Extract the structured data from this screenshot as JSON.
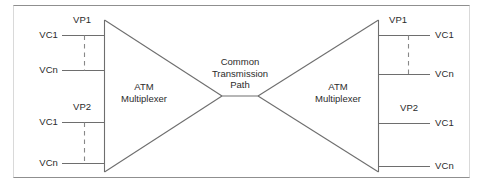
{
  "figure": {
    "stroke_color": "#6e6e6e",
    "frame_color": "#9a9a9a",
    "text_color": "#2b2b2b",
    "background": "#ffffff"
  },
  "center": {
    "line1": "Common",
    "line2": "Transmission",
    "line3": "Path"
  },
  "left_mux": {
    "line1": "ATM",
    "line2": "Multiplexer"
  },
  "right_mux": {
    "line1": "ATM",
    "line2": "Multiplexer"
  },
  "left_groups": [
    {
      "vp_label": "VP1",
      "channels": [
        {
          "label": "VC1"
        },
        {
          "label": "VCn"
        }
      ],
      "has_ellipsis_line": true
    },
    {
      "vp_label": "VP2",
      "channels": [
        {
          "label": "VC1"
        },
        {
          "label": "VCn"
        }
      ],
      "has_ellipsis_line": true
    }
  ],
  "right_groups": [
    {
      "vp_label": "VP1",
      "channels": [
        {
          "label": "VC1"
        },
        {
          "label": "VCn"
        }
      ],
      "has_ellipsis_line": true
    },
    {
      "vp_label": "VP2",
      "channels": [
        {
          "label": "VC1"
        },
        {
          "label": "VCn"
        }
      ],
      "has_ellipsis_line": false
    }
  ]
}
